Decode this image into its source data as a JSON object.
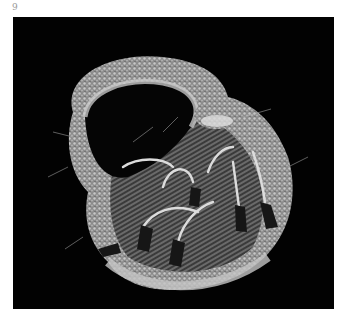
{
  "page": {
    "number": "9"
  },
  "photo": {
    "subject": "woven fiber basket with hooked strands",
    "background_color": "#020202",
    "fiber_color": "#b8b8b8",
    "tip_color": "#1a1a1a"
  }
}
